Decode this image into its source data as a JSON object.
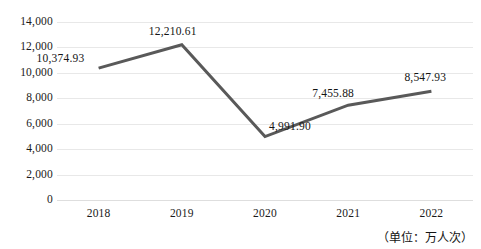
{
  "chart_data": {
    "type": "line",
    "title": "",
    "subtitle": "",
    "xlabel": "",
    "ylabel": "",
    "categories": [
      "2018",
      "2019",
      "2020",
      "2021",
      "2022"
    ],
    "values": [
      10374.93,
      12210.61,
      4991.9,
      7455.88,
      8547.93
    ],
    "point_labels": [
      "10,374.93",
      "12,210.61",
      "4,991.90",
      "7,455.88",
      "8,547.93"
    ],
    "series": [
      {
        "name": "",
        "values": [
          10374.93,
          12210.61,
          4991.9,
          7455.88,
          8547.93
        ],
        "color": "#595959"
      }
    ],
    "ylim": [
      0,
      14000
    ],
    "ytick_values": [
      0,
      2000,
      4000,
      6000,
      8000,
      10000,
      12000,
      14000
    ],
    "ytick_labels": [
      "0",
      "2,000",
      "4,000",
      "6,000",
      "8,000",
      "10,000",
      "12,000",
      "14,000"
    ],
    "grid": "horizontal",
    "legend": "none",
    "annotation": "（单位：万人次）",
    "colors": {
      "line": "#595959",
      "gridline": "#e8e8e8",
      "baseline": "#dedede",
      "text": "#141414",
      "background": "#ffffff"
    }
  }
}
